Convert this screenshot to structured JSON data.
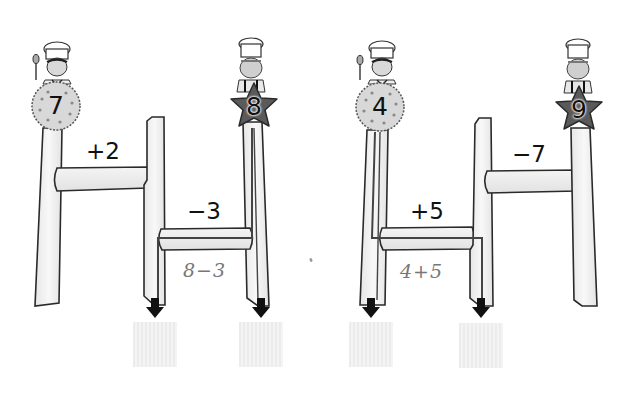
{
  "puzzles": [
    {
      "id": "left",
      "start_characters": [
        {
          "badge_shape": "cookie",
          "number": "7",
          "character": "chef-with-spoon"
        },
        {
          "badge_shape": "star",
          "number": "8",
          "character": "old-chef"
        }
      ],
      "rungs": [
        {
          "operation": "+2"
        },
        {
          "operation": "−3"
        }
      ],
      "worked_hint": "8−3",
      "answer_boxes": [
        {
          "value": ""
        },
        {
          "value": ""
        }
      ]
    },
    {
      "id": "right",
      "start_characters": [
        {
          "badge_shape": "cookie",
          "number": "4",
          "character": "chef-with-spoon"
        },
        {
          "badge_shape": "star",
          "number": "9",
          "character": "old-chef"
        }
      ],
      "rungs": [
        {
          "operation": "+5"
        },
        {
          "operation": "−7"
        }
      ],
      "worked_hint": "4+5",
      "answer_boxes": [
        {
          "value": ""
        },
        {
          "value": ""
        }
      ]
    }
  ],
  "colors": {
    "post_fill": "#f2f2f2",
    "outline": "#2a2a2a",
    "star_fill": "#5a5a5a",
    "cookie_fill": "#d8d8d8",
    "path_line": "#444444",
    "arrow": "#111111",
    "hint_text": "#777777",
    "answer_box": "#eeeeee"
  }
}
